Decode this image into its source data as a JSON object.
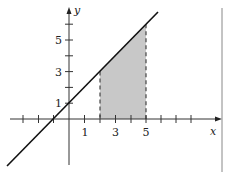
{
  "figure": {
    "type": "graph",
    "axes": {
      "x_label": "x",
      "y_label": "y",
      "x_tick_labels": [
        "1",
        "3",
        "5"
      ],
      "y_tick_labels": [
        "1",
        "3",
        "5"
      ],
      "x_ticks": [
        -3,
        -2,
        -1,
        1,
        2,
        3,
        4,
        5,
        6,
        7,
        8
      ],
      "y_ticks": [
        1,
        2,
        3,
        4,
        5,
        6
      ]
    },
    "line": {
      "equation": "y = x + 1",
      "color": "#111111"
    },
    "shaded_region": {
      "x_from": 2,
      "x_to": 5,
      "fill": "#c8c8c8",
      "boundary_style": "dashed"
    },
    "border_color": "#888888"
  }
}
